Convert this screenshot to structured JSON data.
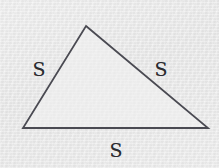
{
  "figure": {
    "kind": "geometry-diagram",
    "shape_name": "triangle",
    "width": 219,
    "height": 168,
    "background_color": "#e7e7e7",
    "stroke_color": "#4a4a52",
    "fill_color": "#f1f1f1",
    "text_color": "#2b2b30",
    "stroke_width": 1.8,
    "vertices": [
      {
        "name": "apex",
        "x": 86,
        "y": 26
      },
      {
        "name": "bottom-right",
        "x": 208,
        "y": 128
      },
      {
        "name": "bottom-left",
        "x": 23,
        "y": 128
      }
    ],
    "polygon_points": "86,26 208,128 23,128",
    "labels": [
      {
        "id": "left",
        "text": "S",
        "x": 39,
        "y": 69,
        "side": "left-side"
      },
      {
        "id": "right",
        "text": "S",
        "x": 161,
        "y": 69,
        "side": "right-side"
      },
      {
        "id": "bottom",
        "text": "S",
        "x": 116,
        "y": 150,
        "side": "bottom-side"
      }
    ]
  }
}
